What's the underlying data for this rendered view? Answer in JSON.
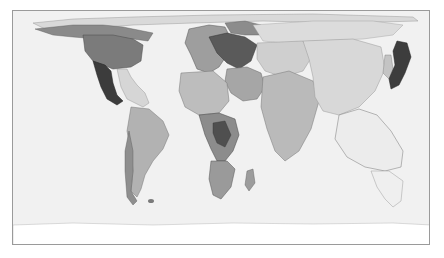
{
  "map": {
    "type": "cartogram",
    "projection": "world equirectangular distorted",
    "background_color": "#f1f1f1",
    "frame_color": "#9a9a9a",
    "regions": [
      {
        "name": "Canada",
        "shade": "#8a8a8a"
      },
      {
        "name": "United States",
        "shade": "#7b7b7b"
      },
      {
        "name": "Mexico",
        "shade": "#3c3c3c"
      },
      {
        "name": "Central America & Caribbean",
        "shade": "#d6d6d6"
      },
      {
        "name": "South America",
        "shade": "#b2b2b2"
      },
      {
        "name": "Chile",
        "shade": "#8f8f8f"
      },
      {
        "name": "Europe West",
        "shade": "#9e9e9e"
      },
      {
        "name": "Europe Central",
        "shade": "#5a5a5a"
      },
      {
        "name": "Russia",
        "shade": "#dcdcdc"
      },
      {
        "name": "Middle East",
        "shade": "#a6a6a6"
      },
      {
        "name": "North Africa",
        "shade": "#bdbdbd"
      },
      {
        "name": "Sub-Saharan Africa",
        "shade": "#8c8c8c"
      },
      {
        "name": "Southern Africa",
        "shade": "#9a9a9a"
      },
      {
        "name": "Madagascar",
        "shade": "#9c9c9c"
      },
      {
        "name": "Central Asia",
        "shade": "#cfcfcf"
      },
      {
        "name": "India",
        "shade": "#bababa"
      },
      {
        "name": "China",
        "shade": "#d8d8d8"
      },
      {
        "name": "Korea",
        "shade": "#c4c4c4"
      },
      {
        "name": "Japan",
        "shade": "#3d3d3d"
      },
      {
        "name": "Southeast Asia",
        "shade": "#ececec"
      },
      {
        "name": "Australia & Oceania",
        "shade": "#efefef"
      },
      {
        "name": "Antarctica",
        "shade": "#ffffff"
      }
    ]
  }
}
